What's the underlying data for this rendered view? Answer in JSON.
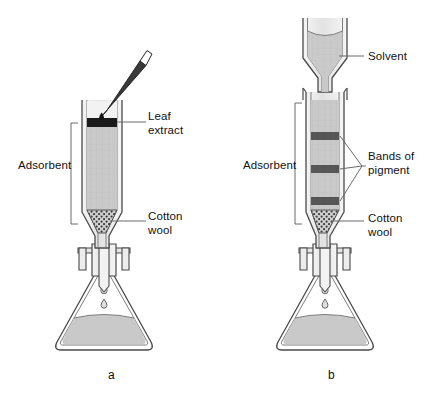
{
  "figure": {
    "width": 434,
    "height": 405,
    "background": "#ffffff"
  },
  "colors": {
    "outline": "#4a4a4a",
    "adsorbent_fill": "#c9c9c9",
    "adsorbent_fill_light": "#d4d4d4",
    "pigment_band": "#565656",
    "leaf_extract_band": "#1a1a1a",
    "solvent_fill": "#cacaca",
    "glass_wall": "#e8e8e8",
    "pipette_body": "#3a3a3a",
    "pipette_tip": "#ffffff",
    "label_text": "#111111",
    "leader_line": "#6a6a6a",
    "bracket_line": "#6a6a6a"
  },
  "panels": [
    {
      "id": "a",
      "caption": "a",
      "caption_x": 108,
      "caption_y": 368,
      "description": "Leaf extract applied to top of adsorbent column",
      "labels": [
        {
          "name": "leaf-extract-label",
          "lines": [
            "Leaf",
            "extract"
          ],
          "text": "Leaf\nextract",
          "x": 148,
          "y": 110
        },
        {
          "name": "adsorbent-label",
          "lines": [
            "Adsorbent"
          ],
          "text": "Adsorbent",
          "x": 18,
          "y": 159
        },
        {
          "name": "cotton-wool-label",
          "lines": [
            "Cotton",
            "wool"
          ],
          "text": "Cotton\nwool",
          "x": 148,
          "y": 210
        }
      ]
    },
    {
      "id": "b",
      "caption": "b",
      "caption_x": 328,
      "caption_y": 368,
      "description": "Solvent added; pigments separate into bands",
      "labels": [
        {
          "name": "solvent-label",
          "lines": [
            "Solvent"
          ],
          "text": "Solvent",
          "x": 368,
          "y": 50
        },
        {
          "name": "adsorbent-label-b",
          "lines": [
            "Adsorbent"
          ],
          "text": "Adsorbent",
          "x": 243,
          "y": 159
        },
        {
          "name": "bands-of-pigment-label",
          "lines": [
            "Bands of",
            "pigment"
          ],
          "text": "Bands of\npigment",
          "x": 368,
          "y": 150
        },
        {
          "name": "cotton-wool-label-b",
          "lines": [
            "Cotton",
            "wool"
          ],
          "text": "Cotton\nwool",
          "x": 368,
          "y": 212
        }
      ]
    }
  ],
  "diagram_data": {
    "panel_a": {
      "column": {
        "x_left": 82,
        "x_right": 122,
        "y_top": 100,
        "y_bottom": 232
      },
      "leaf_extract_band": {
        "y": 119,
        "height": 8,
        "color": "#1a1a1a"
      },
      "adsorbent": {
        "y_top": 127,
        "y_bottom": 210,
        "color": "#c9c9c9"
      },
      "cotton_wool": {
        "y_top": 210,
        "y_bottom": 224,
        "pattern": "dots"
      },
      "pipette": {
        "angle_deg": 52,
        "color": "#3a3a3a",
        "tip": "white"
      },
      "flask": {
        "type": "conical",
        "liquid_level_y": 318
      },
      "drops": 2
    },
    "panel_b": {
      "funnel": {
        "x_left": 303,
        "x_right": 347,
        "y_top": 18,
        "y_bottom": 72,
        "contents": "Solvent"
      },
      "column": {
        "x_left": 306,
        "x_right": 344,
        "y_top": 92,
        "y_bottom": 232
      },
      "adsorbent": {
        "y_top": 100,
        "y_bottom": 210,
        "color": "#c9c9c9"
      },
      "pigment_bands": [
        {
          "index": 1,
          "y": 133,
          "height": 7,
          "color": "#565656"
        },
        {
          "index": 2,
          "y": 166,
          "height": 7,
          "color": "#565656"
        },
        {
          "index": 3,
          "y": 198,
          "height": 7,
          "color": "#565656"
        }
      ],
      "cotton_wool": {
        "y_top": 210,
        "y_bottom": 224,
        "pattern": "dots"
      },
      "flask": {
        "type": "conical",
        "liquid_level_y": 318
      },
      "drops": 2
    }
  }
}
